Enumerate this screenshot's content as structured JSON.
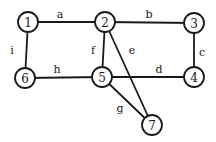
{
  "diagram": {
    "type": "undirected-graph",
    "nodes": [
      {
        "id": "1",
        "label": "1",
        "x": 28,
        "y": 22
      },
      {
        "id": "2",
        "label": "2",
        "x": 105,
        "y": 22
      },
      {
        "id": "3",
        "label": "3",
        "x": 194,
        "y": 23
      },
      {
        "id": "4",
        "label": "4",
        "x": 194,
        "y": 77
      },
      {
        "id": "5",
        "label": "5",
        "x": 102,
        "y": 77
      },
      {
        "id": "6",
        "label": "6",
        "x": 25,
        "y": 78
      },
      {
        "id": "7",
        "label": "7",
        "x": 152,
        "y": 125
      }
    ],
    "edges": [
      {
        "label": "a",
        "from": "1",
        "to": "2",
        "lx": 60,
        "ly": 14
      },
      {
        "label": "b",
        "from": "2",
        "to": "3",
        "lx": 149,
        "ly": 14
      },
      {
        "label": "c",
        "from": "3",
        "to": "4",
        "lx": 202,
        "ly": 52
      },
      {
        "label": "d",
        "from": "5",
        "to": "4",
        "lx": 159,
        "ly": 69
      },
      {
        "label": "e",
        "from": "2",
        "to": "7",
        "lx": 132,
        "ly": 50
      },
      {
        "label": "f",
        "from": "2",
        "to": "5",
        "lx": 93,
        "ly": 50
      },
      {
        "label": "g",
        "from": "5",
        "to": "7",
        "lx": 120,
        "ly": 108
      },
      {
        "label": "h",
        "from": "6",
        "to": "5",
        "lx": 57,
        "ly": 69
      },
      {
        "label": "i",
        "from": "1",
        "to": "6",
        "lx": 12,
        "ly": 50
      }
    ]
  }
}
